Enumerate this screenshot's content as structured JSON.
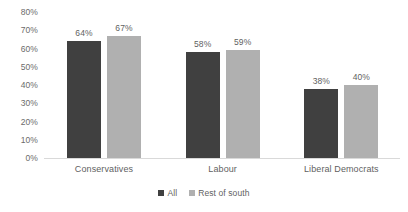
{
  "chart_data": {
    "type": "bar",
    "title": "",
    "subtitle": "",
    "xlabel": "",
    "ylabel": "",
    "categories": [
      "Conservatives",
      "Labour",
      "Liberal Democrats"
    ],
    "series": [
      {
        "name": "All",
        "color": "#404040",
        "values": [
          64,
          58,
          38
        ],
        "labels": [
          "64%",
          "58%",
          "38%"
        ]
      },
      {
        "name": "Rest of south",
        "color": "#b0b0b0",
        "values": [
          67,
          59,
          40
        ],
        "labels": [
          "67%",
          "59%",
          "40%"
        ]
      }
    ],
    "ylim": [
      0,
      80
    ],
    "ytick_values": [
      0,
      10,
      20,
      30,
      40,
      50,
      60,
      70,
      80
    ],
    "ytick_labels": [
      "0%",
      "10%",
      "20%",
      "30%",
      "40%",
      "50%",
      "60%",
      "70%",
      "80%"
    ],
    "grid": false,
    "legend_position": "bottom",
    "value_labels_shown": true,
    "background_color": "#ffffff",
    "text_color": "#5f5f5f"
  }
}
